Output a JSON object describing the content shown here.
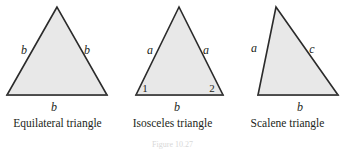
{
  "figure": {
    "background_color": "#ffffff",
    "fill_color": "#e8e8e8",
    "stroke_color": "#2b2b2b",
    "text_color": "#231f20",
    "caption_number": "Figure 10.27"
  },
  "triangles": [
    {
      "id": "equilateral",
      "caption": "Equilateral triangle",
      "vertices": [
        [
          57,
          7
        ],
        [
          7,
          95
        ],
        [
          107,
          95
        ]
      ],
      "labels": [
        {
          "text": "b",
          "x": 24,
          "y": 54,
          "kind": "side",
          "name": "side-label-left"
        },
        {
          "text": "b",
          "x": 87,
          "y": 54,
          "kind": "side",
          "name": "side-label-right"
        },
        {
          "text": "b",
          "x": 54,
          "y": 111,
          "kind": "side",
          "name": "side-label-base"
        }
      ]
    },
    {
      "id": "isosceles",
      "caption": "Isosceles triangle",
      "vertices": [
        [
          179,
          7
        ],
        [
          136,
          95
        ],
        [
          223,
          95
        ]
      ],
      "labels": [
        {
          "text": "a",
          "x": 150,
          "y": 54,
          "kind": "side",
          "name": "side-label-left"
        },
        {
          "text": "a",
          "x": 206,
          "y": 54,
          "kind": "side",
          "name": "side-label-right"
        },
        {
          "text": "b",
          "x": 177,
          "y": 111,
          "kind": "side",
          "name": "side-label-base"
        },
        {
          "text": "1",
          "x": 145,
          "y": 92,
          "kind": "angle",
          "name": "angle-label-1"
        },
        {
          "text": "2",
          "x": 212,
          "y": 92,
          "kind": "angle",
          "name": "angle-label-2"
        }
      ]
    },
    {
      "id": "scalene",
      "caption": "Scalene triangle",
      "vertices": [
        [
          276,
          7
        ],
        [
          258,
          95
        ],
        [
          338,
          95
        ]
      ],
      "labels": [
        {
          "text": "a",
          "x": 254,
          "y": 52,
          "kind": "side",
          "name": "side-label-left"
        },
        {
          "text": "c",
          "x": 312,
          "y": 53,
          "kind": "side",
          "name": "side-label-hyp"
        },
        {
          "text": "b",
          "x": 300,
          "y": 111,
          "kind": "side",
          "name": "side-label-base"
        }
      ]
    }
  ]
}
